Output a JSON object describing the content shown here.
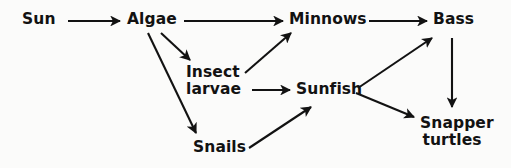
{
  "diagram": {
    "type": "food-web",
    "background_color": "#fbfbfa",
    "text_color": "#121212",
    "arrow_color": "#121212",
    "nodes": [
      {
        "id": "sun",
        "label": "Sun",
        "x": 40,
        "y": 20
      },
      {
        "id": "algae",
        "label": "Algae",
        "x": 152,
        "y": 20
      },
      {
        "id": "minnows",
        "label": "Minnows",
        "x": 324,
        "y": 20
      },
      {
        "id": "bass",
        "label": "Bass",
        "x": 451,
        "y": 20
      },
      {
        "id": "insect",
        "label": "Insect\nlarvae",
        "x": 214,
        "y": 82
      },
      {
        "id": "sunfish",
        "label": "Sunfish",
        "x": 330,
        "y": 90
      },
      {
        "id": "snails",
        "label": "Snails",
        "x": 219,
        "y": 148
      },
      {
        "id": "snapper",
        "label": "Snapper\nturtles",
        "x": 452,
        "y": 133
      }
    ],
    "edges": [
      {
        "from": "sun",
        "to": "algae"
      },
      {
        "from": "algae",
        "to": "minnows"
      },
      {
        "from": "algae",
        "to": "insect"
      },
      {
        "from": "algae",
        "to": "snails"
      },
      {
        "from": "insect",
        "to": "minnows"
      },
      {
        "from": "insect",
        "to": "sunfish"
      },
      {
        "from": "snails",
        "to": "sunfish"
      },
      {
        "from": "minnows",
        "to": "bass"
      },
      {
        "from": "sunfish",
        "to": "bass"
      },
      {
        "from": "sunfish",
        "to": "snapper"
      },
      {
        "from": "bass",
        "to": "snapper"
      }
    ]
  }
}
